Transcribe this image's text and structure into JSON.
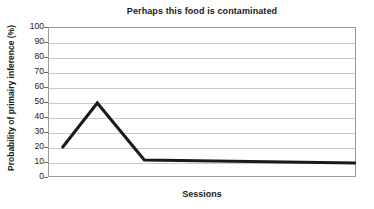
{
  "chart_data": {
    "type": "line",
    "title": "Perhaps this food is contaminated",
    "xlabel": "Sessions",
    "ylabel": "Probability of primairy inference (%)",
    "ylim": [
      0,
      100
    ],
    "ytick_labels": [
      "100",
      "90",
      "80",
      "70",
      "60",
      "50",
      "40",
      "30",
      "20",
      "10",
      "0"
    ],
    "ytick_values": [
      100,
      90,
      80,
      70,
      60,
      50,
      40,
      30,
      20,
      10,
      0
    ],
    "xtick_labels": [],
    "grid": "horizontal",
    "legend": "none",
    "series": [
      {
        "name": "Probability of primairy inference",
        "color": "#1a1a1a",
        "line_width": 3,
        "x": [
          0,
          12,
          28,
          100
        ],
        "values": [
          20,
          50,
          12,
          10
        ]
      }
    ]
  }
}
